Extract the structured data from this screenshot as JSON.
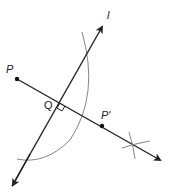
{
  "diagram": {
    "type": "geometric-construction",
    "labels": {
      "p": "P",
      "q": "Q",
      "p_prime": "P'",
      "line": "l"
    },
    "colors": {
      "line": "#222222",
      "arc": "#666666",
      "point": "#111111"
    },
    "points": {
      "P": [
        17,
        79
      ],
      "Q": [
        56,
        101
      ],
      "P_prime": [
        102,
        126
      ]
    }
  }
}
